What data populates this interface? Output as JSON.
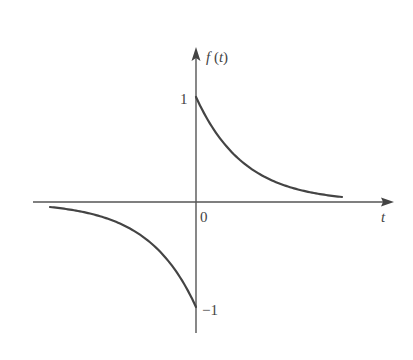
{
  "chart_data": {
    "type": "line",
    "title": "",
    "xlabel": "t",
    "ylabel": "f(t)",
    "origin_label": "0",
    "y_tick_labels": [
      "1",
      "-1"
    ],
    "y_ticks": [
      1,
      -1
    ],
    "grid": false,
    "legend": null,
    "series": [
      {
        "name": "f(t) for t>0",
        "description": "decaying exponential e^(-a t), starting at 1 and approaching 0",
        "x": [
          0,
          0.5,
          1,
          1.5,
          2,
          2.5,
          3
        ],
        "y": [
          1.0,
          0.61,
          0.37,
          0.22,
          0.14,
          0.08,
          0.05
        ]
      },
      {
        "name": "f(t) for t<0",
        "description": "-e^(a t), approaching -1 at t=0 and 0 as t goes to -infinity",
        "x": [
          -3,
          -2.5,
          -2,
          -1.5,
          -1,
          -0.5,
          0
        ],
        "y": [
          -0.05,
          -0.08,
          -0.14,
          -0.22,
          -0.37,
          -0.61,
          -1.0
        ]
      }
    ]
  },
  "labels": {
    "y_axis": "f(t)",
    "x_axis": "t",
    "origin": "0",
    "y_pos_one": "1",
    "y_neg_one": "−1"
  }
}
